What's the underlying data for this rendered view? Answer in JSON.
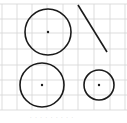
{
  "figure": {
    "grid": {
      "color": "#d4d4d4",
      "vertical_x": [
        2,
        17,
        32,
        47,
        63,
        78,
        94,
        110,
        125
      ],
      "horizontal_y": [
        4,
        19,
        33,
        49,
        65,
        80,
        95,
        110
      ],
      "x_range": [
        0,
        127
      ],
      "y_range": [
        4,
        110
      ]
    },
    "stroke_color": "#1a1a1a",
    "shapes": [
      {
        "type": "circle",
        "name": "circle-top-left",
        "cx": 48,
        "cy": 32,
        "r": 23,
        "center_dot": true
      },
      {
        "type": "line",
        "name": "diagonal-line",
        "x1": 78,
        "y1": 5,
        "x2": 107,
        "y2": 52
      },
      {
        "type": "circle",
        "name": "circle-bottom-left",
        "cx": 42,
        "cy": 85,
        "r": 22,
        "center_dot": true
      },
      {
        "type": "circle",
        "name": "circle-bottom-right",
        "cx": 99,
        "cy": 85,
        "r": 15,
        "center_dot": true
      }
    ],
    "caption": "· · · · · · · · ·"
  }
}
